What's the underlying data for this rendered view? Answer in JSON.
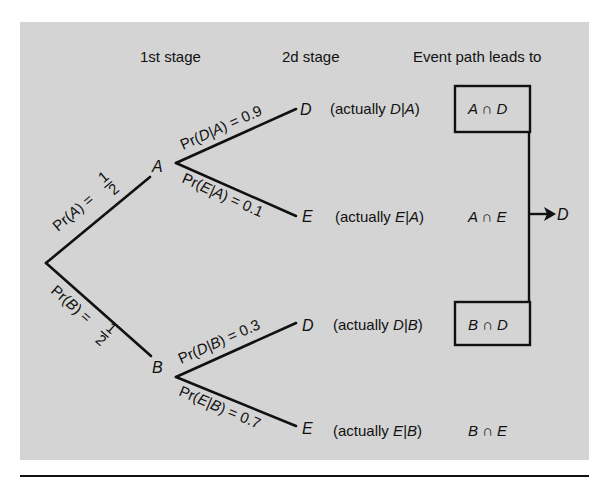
{
  "headers": {
    "stage1": "1st stage",
    "stage2": "2d stage",
    "event_path": "Event path leads to"
  },
  "nodes": {
    "A": "A",
    "B": "B",
    "D_top": "D",
    "E_top": "E",
    "D_bottom": "D",
    "E_bottom": "E",
    "final_D": "D"
  },
  "branch_labels": {
    "prA": {
      "prefix": "Pr(",
      "var": "A",
      "suffix": ") = ",
      "num": "1",
      "den": "2"
    },
    "prB": {
      "prefix": "Pr(",
      "var": "B",
      "suffix": ") = ",
      "num": "1",
      "den": "2"
    },
    "prDA": {
      "prefix": "Pr(",
      "var": "D|A",
      "suffix": ") = 0.9"
    },
    "prEA": {
      "prefix": "Pr(",
      "var": "E|A",
      "suffix": ") = 0.1"
    },
    "prDB": {
      "prefix": "Pr(",
      "var": "D|B",
      "suffix": ") = 0.3"
    },
    "prEB": {
      "prefix": "Pr(",
      "var": "E|B",
      "suffix": ") = 0.7"
    }
  },
  "actually": {
    "row1": {
      "prefix": "(actually ",
      "var": "D|A",
      "suffix": ")"
    },
    "row2": {
      "prefix": "(actually ",
      "var": "E|A",
      "suffix": ")"
    },
    "row3": {
      "prefix": "(actually ",
      "var": "D|B",
      "suffix": ")"
    },
    "row4": {
      "prefix": "(actually ",
      "var": "E|B",
      "suffix": ")"
    }
  },
  "outcomes": {
    "row1": "A ∩ D",
    "row2": "A ∩ E",
    "row3": "B ∩ D",
    "row4": "B ∩ E"
  },
  "colors": {
    "panel": "#d4d4d4",
    "ink": "#111111"
  }
}
